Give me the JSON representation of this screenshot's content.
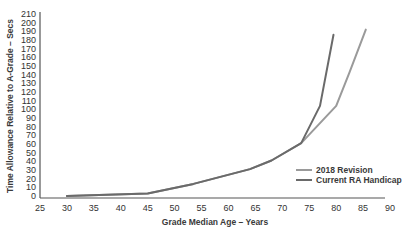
{
  "chart_data": {
    "type": "line",
    "title": "",
    "xlabel": "Grade Median Age – Years",
    "ylabel": "Time Allowance Relative to A-Grade – Secs",
    "xlim": [
      25,
      90
    ],
    "ylim": [
      0,
      210
    ],
    "xticks": [
      25,
      30,
      35,
      40,
      45,
      50,
      55,
      60,
      65,
      70,
      75,
      80,
      85,
      90
    ],
    "yticks": [
      0,
      10,
      20,
      30,
      40,
      50,
      60,
      70,
      80,
      90,
      100,
      110,
      120,
      130,
      140,
      150,
      160,
      170,
      180,
      190,
      200,
      210
    ],
    "grid": false,
    "legend_position": "lower right",
    "series": [
      {
        "name": "2018 Revision",
        "color": "#9a9a9a",
        "x": [
          30,
          45,
          53.5,
          64,
          68,
          73.5,
          80,
          82.5,
          85.5
        ],
        "y": [
          0,
          3,
          14,
          31,
          41,
          61,
          104,
          143,
          192
        ]
      },
      {
        "name": "Current RA Handicap",
        "color": "#6a6a6a",
        "x": [
          30,
          45,
          53.5,
          64,
          68,
          73.5,
          77,
          79.5
        ],
        "y": [
          0,
          3,
          14,
          31,
          41,
          61,
          104,
          186
        ]
      }
    ]
  }
}
